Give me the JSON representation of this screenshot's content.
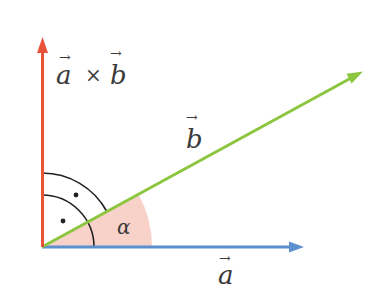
{
  "diagram": {
    "type": "vector-cross-product",
    "origin": [
      42,
      247
    ],
    "vectors": {
      "a": {
        "label": "a",
        "color": "#5b8fce",
        "tip": [
          302,
          247
        ]
      },
      "b": {
        "label": "b",
        "color": "#8cc63f",
        "tip": [
          362,
          72
        ]
      },
      "axb": {
        "label_left": "a",
        "operator": "×",
        "label_right": "b",
        "color": "#e8533a",
        "tip": [
          43,
          38
        ]
      }
    },
    "angle": {
      "label": "α",
      "fill": "#f7c9c0",
      "radius": 110
    },
    "right_angle_marks": {
      "color": "#222222",
      "inner_radius": 52,
      "outer_radius": 74
    },
    "arrow_symbol": "→"
  }
}
